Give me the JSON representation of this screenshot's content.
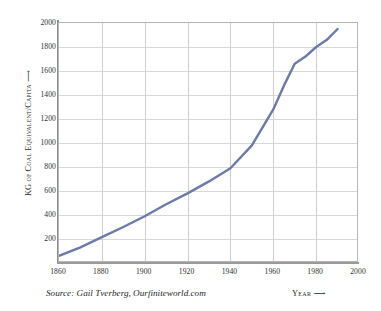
{
  "chart_data": {
    "type": "line",
    "title": "",
    "xlabel": "Year",
    "ylabel": "KG of Coal Equivalent/Capita",
    "xlim": [
      1860,
      2000
    ],
    "ylim": [
      0,
      2000
    ],
    "grid": true,
    "legend_position": "none",
    "line_color": "#6b7aa8",
    "x_ticks": [
      "1860",
      "1880",
      "1900",
      "1920",
      "1940",
      "1960",
      "1980",
      "2000"
    ],
    "y_ticks": [
      "200",
      "400",
      "600",
      "800",
      "1000",
      "1200",
      "1400",
      "1600",
      "1800",
      "2000"
    ],
    "series": [
      {
        "name": "World energy consumption per capita",
        "x": [
          1860,
          1870,
          1880,
          1890,
          1900,
          1910,
          1920,
          1930,
          1940,
          1950,
          1960,
          1965,
          1970,
          1975,
          1980,
          1985,
          1990
        ],
        "values": [
          60,
          130,
          215,
          300,
          390,
          490,
          580,
          680,
          790,
          980,
          1280,
          1480,
          1660,
          1720,
          1800,
          1860,
          1950
        ]
      }
    ],
    "annotations": {
      "source": "Source: Gail Tverberg, Ourfiniteworld.com",
      "y_axis_arrow": "⟶",
      "x_axis_arrow": "⟶"
    }
  },
  "axes": {
    "y_title": "KG of Coal Equivalent/Capita",
    "x_title": "Year"
  }
}
